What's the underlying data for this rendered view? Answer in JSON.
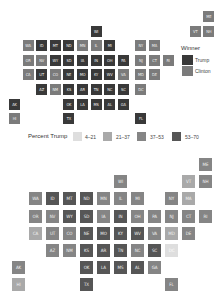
{
  "chart_data": [
    {
      "type": "heatmap",
      "title": "Winner",
      "subtype": "tile-grid-map",
      "legend": [
        {
          "label": "Trump",
          "color": "#393939"
        },
        {
          "label": "Clinton",
          "color": "#7b7b7b"
        }
      ],
      "states": [
        {
          "abbr": "ME",
          "col": 14,
          "row": 0,
          "winner": "Clinton"
        },
        {
          "abbr": "WI",
          "col": 6,
          "row": 1,
          "winner": "Trump"
        },
        {
          "abbr": "VT",
          "col": 13,
          "row": 1,
          "winner": "Clinton"
        },
        {
          "abbr": "NH",
          "col": 14,
          "row": 1,
          "winner": "Clinton"
        },
        {
          "abbr": "WA",
          "col": 1,
          "row": 2,
          "winner": "Clinton"
        },
        {
          "abbr": "ID",
          "col": 2,
          "row": 2,
          "winner": "Trump"
        },
        {
          "abbr": "MT",
          "col": 3,
          "row": 2,
          "winner": "Trump"
        },
        {
          "abbr": "ND",
          "col": 4,
          "row": 2,
          "winner": "Trump"
        },
        {
          "abbr": "MN",
          "col": 5,
          "row": 2,
          "winner": "Clinton"
        },
        {
          "abbr": "IL",
          "col": 6,
          "row": 2,
          "winner": "Clinton"
        },
        {
          "abbr": "MI",
          "col": 7,
          "row": 2,
          "winner": "Trump"
        },
        {
          "abbr": "NY",
          "col": 9,
          "row": 2,
          "winner": "Clinton"
        },
        {
          "abbr": "MA",
          "col": 10,
          "row": 2,
          "winner": "Clinton"
        },
        {
          "abbr": "OR",
          "col": 1,
          "row": 3,
          "winner": "Clinton"
        },
        {
          "abbr": "NV",
          "col": 2,
          "row": 3,
          "winner": "Clinton"
        },
        {
          "abbr": "WY",
          "col": 3,
          "row": 3,
          "winner": "Trump"
        },
        {
          "abbr": "SD",
          "col": 4,
          "row": 3,
          "winner": "Trump"
        },
        {
          "abbr": "IA",
          "col": 5,
          "row": 3,
          "winner": "Trump"
        },
        {
          "abbr": "IN",
          "col": 6,
          "row": 3,
          "winner": "Trump"
        },
        {
          "abbr": "OH",
          "col": 7,
          "row": 3,
          "winner": "Trump"
        },
        {
          "abbr": "PA",
          "col": 8,
          "row": 3,
          "winner": "Trump"
        },
        {
          "abbr": "NJ",
          "col": 9,
          "row": 3,
          "winner": "Clinton"
        },
        {
          "abbr": "CT",
          "col": 10,
          "row": 3,
          "winner": "Clinton"
        },
        {
          "abbr": "RI",
          "col": 11,
          "row": 3,
          "winner": "Clinton"
        },
        {
          "abbr": "CA",
          "col": 1,
          "row": 4,
          "winner": "Clinton"
        },
        {
          "abbr": "UT",
          "col": 2,
          "row": 4,
          "winner": "Trump"
        },
        {
          "abbr": "CO",
          "col": 3,
          "row": 4,
          "winner": "Clinton"
        },
        {
          "abbr": "NE",
          "col": 4,
          "row": 4,
          "winner": "Trump"
        },
        {
          "abbr": "MO",
          "col": 5,
          "row": 4,
          "winner": "Trump"
        },
        {
          "abbr": "KY",
          "col": 6,
          "row": 4,
          "winner": "Trump"
        },
        {
          "abbr": "WV",
          "col": 7,
          "row": 4,
          "winner": "Trump"
        },
        {
          "abbr": "VA",
          "col": 8,
          "row": 4,
          "winner": "Clinton"
        },
        {
          "abbr": "MD",
          "col": 9,
          "row": 4,
          "winner": "Clinton"
        },
        {
          "abbr": "DE",
          "col": 10,
          "row": 4,
          "winner": "Clinton"
        },
        {
          "abbr": "AZ",
          "col": 2,
          "row": 5,
          "winner": "Trump"
        },
        {
          "abbr": "NM",
          "col": 3,
          "row": 5,
          "winner": "Clinton"
        },
        {
          "abbr": "KS",
          "col": 4,
          "row": 5,
          "winner": "Trump"
        },
        {
          "abbr": "AR",
          "col": 5,
          "row": 5,
          "winner": "Trump"
        },
        {
          "abbr": "TN",
          "col": 6,
          "row": 5,
          "winner": "Trump"
        },
        {
          "abbr": "NC",
          "col": 7,
          "row": 5,
          "winner": "Trump"
        },
        {
          "abbr": "SC",
          "col": 8,
          "row": 5,
          "winner": "Trump"
        },
        {
          "abbr": "DC",
          "col": 9,
          "row": 5,
          "winner": "Clinton"
        },
        {
          "abbr": "AK",
          "col": 0,
          "row": 6,
          "winner": "Trump"
        },
        {
          "abbr": "OK",
          "col": 4,
          "row": 6,
          "winner": "Trump"
        },
        {
          "abbr": "LA",
          "col": 5,
          "row": 6,
          "winner": "Trump"
        },
        {
          "abbr": "MS",
          "col": 6,
          "row": 6,
          "winner": "Trump"
        },
        {
          "abbr": "AL",
          "col": 7,
          "row": 6,
          "winner": "Trump"
        },
        {
          "abbr": "GA",
          "col": 8,
          "row": 6,
          "winner": "Trump"
        },
        {
          "abbr": "HI",
          "col": 0,
          "row": 7,
          "winner": "Clinton"
        },
        {
          "abbr": "TX",
          "col": 4,
          "row": 7,
          "winner": "Trump"
        },
        {
          "abbr": "FL",
          "col": 9,
          "row": 7,
          "winner": "Trump"
        }
      ]
    },
    {
      "type": "heatmap",
      "title": "Percent Trump",
      "subtype": "tile-grid-map",
      "legend": [
        {
          "label": "4–21",
          "color": "#dedede"
        },
        {
          "label": "21–37",
          "color": "#a9a9a9"
        },
        {
          "label": "37–53",
          "color": "#858585"
        },
        {
          "label": "53–70",
          "color": "#565656"
        }
      ],
      "states": [
        {
          "abbr": "ME",
          "col": 11,
          "row": 0,
          "bin": "37–53"
        },
        {
          "abbr": "WI",
          "col": 6,
          "row": 1,
          "bin": "37–53"
        },
        {
          "abbr": "VT",
          "col": 10,
          "row": 1,
          "bin": "21–37"
        },
        {
          "abbr": "NH",
          "col": 11,
          "row": 1,
          "bin": "37–53"
        },
        {
          "abbr": "WA",
          "col": 1,
          "row": 2,
          "bin": "37–53"
        },
        {
          "abbr": "ID",
          "col": 2,
          "row": 2,
          "bin": "53–70"
        },
        {
          "abbr": "MT",
          "col": 3,
          "row": 2,
          "bin": "53–70"
        },
        {
          "abbr": "ND",
          "col": 4,
          "row": 2,
          "bin": "53–70"
        },
        {
          "abbr": "MN",
          "col": 5,
          "row": 2,
          "bin": "37–53"
        },
        {
          "abbr": "IL",
          "col": 6,
          "row": 2,
          "bin": "37–53"
        },
        {
          "abbr": "MI",
          "col": 7,
          "row": 2,
          "bin": "37–53"
        },
        {
          "abbr": "NY",
          "col": 9,
          "row": 2,
          "bin": "37–53"
        },
        {
          "abbr": "MA",
          "col": 10,
          "row": 2,
          "bin": "21–37"
        },
        {
          "abbr": "OR",
          "col": 1,
          "row": 3,
          "bin": "37–53"
        },
        {
          "abbr": "NV",
          "col": 2,
          "row": 3,
          "bin": "37–53"
        },
        {
          "abbr": "WY",
          "col": 3,
          "row": 3,
          "bin": "53–70"
        },
        {
          "abbr": "SD",
          "col": 4,
          "row": 3,
          "bin": "53–70"
        },
        {
          "abbr": "IA",
          "col": 5,
          "row": 3,
          "bin": "37–53"
        },
        {
          "abbr": "IN",
          "col": 6,
          "row": 3,
          "bin": "53–70"
        },
        {
          "abbr": "OH",
          "col": 7,
          "row": 3,
          "bin": "37–53"
        },
        {
          "abbr": "PA",
          "col": 8,
          "row": 3,
          "bin": "37–53"
        },
        {
          "abbr": "NJ",
          "col": 9,
          "row": 3,
          "bin": "37–53"
        },
        {
          "abbr": "CT",
          "col": 10,
          "row": 3,
          "bin": "37–53"
        },
        {
          "abbr": "RI",
          "col": 11,
          "row": 3,
          "bin": "37–53"
        },
        {
          "abbr": "CA",
          "col": 1,
          "row": 4,
          "bin": "21–37"
        },
        {
          "abbr": "UT",
          "col": 2,
          "row": 4,
          "bin": "37–53"
        },
        {
          "abbr": "CO",
          "col": 3,
          "row": 4,
          "bin": "37–53"
        },
        {
          "abbr": "NE",
          "col": 4,
          "row": 4,
          "bin": "53–70"
        },
        {
          "abbr": "MO",
          "col": 5,
          "row": 4,
          "bin": "53–70"
        },
        {
          "abbr": "KY",
          "col": 6,
          "row": 4,
          "bin": "53–70"
        },
        {
          "abbr": "WV",
          "col": 7,
          "row": 4,
          "bin": "53–70"
        },
        {
          "abbr": "VA",
          "col": 8,
          "row": 4,
          "bin": "37–53"
        },
        {
          "abbr": "MD",
          "col": 9,
          "row": 4,
          "bin": "21–37"
        },
        {
          "abbr": "DE",
          "col": 10,
          "row": 4,
          "bin": "37–53"
        },
        {
          "abbr": "AZ",
          "col": 2,
          "row": 5,
          "bin": "37–53"
        },
        {
          "abbr": "NM",
          "col": 3,
          "row": 5,
          "bin": "37–53"
        },
        {
          "abbr": "KS",
          "col": 4,
          "row": 5,
          "bin": "53–70"
        },
        {
          "abbr": "AR",
          "col": 5,
          "row": 5,
          "bin": "53–70"
        },
        {
          "abbr": "TN",
          "col": 6,
          "row": 5,
          "bin": "53–70"
        },
        {
          "abbr": "NC",
          "col": 7,
          "row": 5,
          "bin": "37–53"
        },
        {
          "abbr": "SC",
          "col": 8,
          "row": 5,
          "bin": "53–70"
        },
        {
          "abbr": "DC",
          "col": 9,
          "row": 5,
          "bin": "4–21"
        },
        {
          "abbr": "AK",
          "col": 0,
          "row": 6,
          "bin": "37–53"
        },
        {
          "abbr": "OK",
          "col": 4,
          "row": 6,
          "bin": "53–70"
        },
        {
          "abbr": "LA",
          "col": 5,
          "row": 6,
          "bin": "53–70"
        },
        {
          "abbr": "MS",
          "col": 6,
          "row": 6,
          "bin": "53–70"
        },
        {
          "abbr": "AL",
          "col": 7,
          "row": 6,
          "bin": "53–70"
        },
        {
          "abbr": "GA",
          "col": 8,
          "row": 6,
          "bin": "37–53"
        },
        {
          "abbr": "HI",
          "col": 0,
          "row": 7,
          "bin": "21–37"
        },
        {
          "abbr": "TX",
          "col": 4,
          "row": 7,
          "bin": "53–70"
        },
        {
          "abbr": "FL",
          "col": 9,
          "row": 7,
          "bin": "37–53"
        }
      ]
    }
  ],
  "legend_top": {
    "title": "Winner",
    "items": [
      "Trump",
      "Clinton"
    ]
  },
  "legend_mid": {
    "title": "Percent Trump",
    "items": [
      "4–21",
      "21–37",
      "37–53",
      "53–70"
    ]
  }
}
